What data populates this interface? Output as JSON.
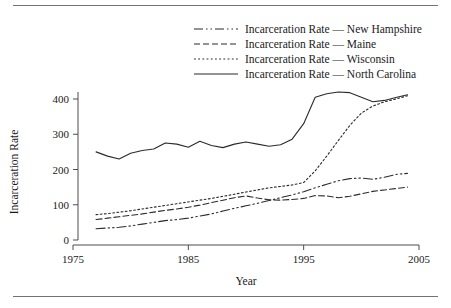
{
  "figure": {
    "rules": {
      "top": "horizontal-rule",
      "bottom": "horizontal-rule"
    }
  },
  "chart_data": {
    "type": "line",
    "title": "",
    "xlabel": "Year",
    "ylabel": "Incarceration Rate",
    "xlim": [
      1975,
      2005
    ],
    "ylim": [
      0,
      440
    ],
    "xticks": [
      1975,
      1985,
      1995,
      2005
    ],
    "xtick_labels": [
      "1975",
      "1985",
      "1995",
      "2005"
    ],
    "yticks": [
      0,
      100,
      200,
      300,
      400
    ],
    "ytick_labels": [
      "0",
      "100",
      "200",
      "300",
      "400"
    ],
    "grid": false,
    "legend_position": "top-right",
    "line_color": "#2b2b2b",
    "series": [
      {
        "name": "Incarceration Rate — New Hampshire",
        "state": "New Hampshire",
        "dash": "dashdotdot",
        "dash_pattern": "9,3,1.5,3,1.5,3",
        "x": [
          1977,
          1978,
          1979,
          1980,
          1981,
          1982,
          1983,
          1984,
          1985,
          1986,
          1987,
          1988,
          1989,
          1990,
          1991,
          1992,
          1993,
          1994,
          1995,
          1996,
          1997,
          1998,
          1999,
          2000,
          2001,
          2002,
          2003,
          2004
        ],
        "values": [
          32,
          34,
          36,
          40,
          45,
          50,
          55,
          58,
          62,
          68,
          74,
          82,
          90,
          97,
          104,
          112,
          120,
          128,
          137,
          148,
          158,
          168,
          174,
          176,
          172,
          178,
          186,
          189
        ]
      },
      {
        "name": "Incarceration Rate — Maine",
        "state": "Maine",
        "dash": "dashed",
        "dash_pattern": "6,3",
        "x": [
          1977,
          1978,
          1979,
          1980,
          1981,
          1982,
          1983,
          1984,
          1985,
          1986,
          1987,
          1988,
          1989,
          1990,
          1991,
          1992,
          1993,
          1994,
          1995,
          1996,
          1997,
          1998,
          1999,
          2000,
          2001,
          2002,
          2003,
          2004
        ],
        "values": [
          58,
          62,
          66,
          70,
          74,
          79,
          84,
          88,
          93,
          99,
          106,
          113,
          120,
          125,
          119,
          114,
          113,
          115,
          118,
          126,
          125,
          120,
          124,
          131,
          138,
          142,
          146,
          150
        ]
      },
      {
        "name": "Incarceration Rate — Wisconsin",
        "state": "Wisconsin",
        "dash": "dotted",
        "dash_pattern": "1.8,2.4",
        "x": [
          1977,
          1978,
          1979,
          1980,
          1981,
          1982,
          1983,
          1984,
          1985,
          1986,
          1987,
          1988,
          1989,
          1990,
          1991,
          1992,
          1993,
          1994,
          1995,
          1996,
          1997,
          1998,
          1999,
          2000,
          2001,
          2002,
          2003,
          2004
        ],
        "values": [
          72,
          75,
          79,
          83,
          88,
          93,
          98,
          103,
          108,
          113,
          118,
          124,
          130,
          136,
          142,
          148,
          152,
          156,
          163,
          196,
          238,
          282,
          325,
          360,
          380,
          392,
          400,
          409
        ]
      },
      {
        "name": "Incarceration Rate — North Carolina",
        "state": "North Carolina",
        "dash": "solid",
        "dash_pattern": "",
        "x": [
          1977,
          1978,
          1979,
          1980,
          1981,
          1982,
          1983,
          1984,
          1985,
          1986,
          1987,
          1988,
          1989,
          1990,
          1991,
          1992,
          1993,
          1994,
          1995,
          1996,
          1997,
          1998,
          1999,
          2000,
          2001,
          2002,
          2003,
          2004
        ],
        "values": [
          250,
          238,
          230,
          246,
          254,
          258,
          275,
          272,
          263,
          280,
          268,
          262,
          272,
          278,
          272,
          266,
          270,
          286,
          330,
          405,
          415,
          420,
          418,
          405,
          392,
          396,
          404,
          412
        ]
      }
    ]
  }
}
